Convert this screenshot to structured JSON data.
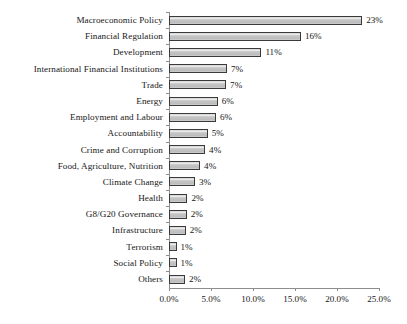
{
  "chart_data": {
    "type": "bar",
    "orientation": "horizontal",
    "title": "",
    "subtitle": "",
    "xlabel": "",
    "ylabel": "",
    "xlim": [
      0,
      25
    ],
    "grid": false,
    "legend": null,
    "xtick_labels": [
      "0.0%",
      "5.0%",
      "10.0%",
      "15.0%",
      "20.0%",
      "25.0%"
    ],
    "xtick_values": [
      0,
      5,
      10,
      15,
      20,
      25
    ],
    "categories": [
      "Macroeconomic Policy",
      "Financial Regulation",
      "Development",
      "International Financial Institutions",
      "Trade",
      "Energy",
      "Employment and Labour",
      "Accountability",
      "Crime and Corruption",
      "Food, Agriculture, Nutrition",
      "Climate Change",
      "Health",
      "G8/G20 Governance",
      "Infrastructure",
      "Terrorism",
      "Social Policy",
      "Others"
    ],
    "values": [
      23,
      15.7,
      11,
      6.9,
      6.8,
      5.8,
      5.6,
      4.6,
      4.3,
      3.7,
      3.1,
      2.2,
      2.1,
      2.0,
      0.9,
      0.9,
      1.9
    ],
    "data_labels": [
      "23%",
      "16%",
      "11%",
      "7%",
      "7%",
      "6%",
      "6%",
      "5%",
      "4%",
      "4%",
      "3%",
      "2%",
      "2%",
      "2%",
      "1%",
      "1%",
      "2%"
    ],
    "colors": {
      "bar_fill": "#c9c9c9",
      "bar_border": "#3a3a3a",
      "axis": "#8d8d8d",
      "text": "#161616",
      "background": "#ffffff"
    }
  }
}
